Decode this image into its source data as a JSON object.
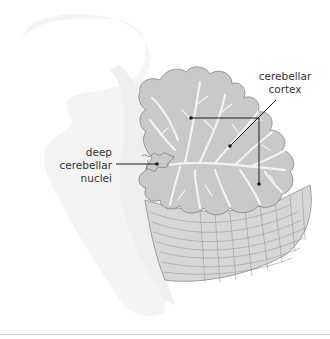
{
  "figure": {
    "labels": {
      "cerebellar_cortex": "cerebellar\ncortex",
      "cerebellar_cortex_line1": "cerebellar",
      "cerebellar_cortex_line2": "cortex",
      "deep_nuclei_line1": "deep",
      "deep_nuclei_line2": "cerebellar",
      "deep_nuclei_line3": "nuclei"
    },
    "colors": {
      "background": "#ffffff",
      "brainstem_silhouette": "#f3f3f3",
      "cortex_fill": "#c9c9c9",
      "cortex_outline": "#8a8a8a",
      "white_matter": "#f2f2f2",
      "lower_cerebellum_fill": "#d6d6d6",
      "leader_line": "#1a1a1a",
      "label_text": "#333333"
    }
  }
}
